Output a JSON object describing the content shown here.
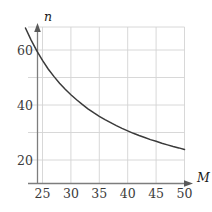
{
  "chart_data": {
    "type": "line",
    "title": "",
    "xlabel": "M",
    "ylabel": "n",
    "xlim": [
      22,
      50
    ],
    "ylim": [
      13.5,
      70
    ],
    "grid": true,
    "legend": null,
    "x_ticks": [
      25,
      30,
      35,
      40,
      45,
      50
    ],
    "y_ticks": [
      20,
      40,
      60
    ],
    "x_tick_labels": [
      "25",
      "30",
      "35",
      "40",
      "45",
      "50"
    ],
    "y_tick_labels": [
      "20",
      "40",
      "60"
    ],
    "series": [
      {
        "name": "n vs M",
        "x": [
          22,
          23,
          24,
          25,
          26,
          27,
          28,
          29,
          30,
          31,
          32,
          33,
          34,
          35,
          36,
          37,
          38,
          39,
          40,
          41,
          42,
          43,
          44,
          45,
          46,
          47,
          48,
          49,
          50
        ],
        "y": [
          68.0,
          63.6,
          59.7,
          56.2,
          53.1,
          50.4,
          47.9,
          45.7,
          43.7,
          41.9,
          40.2,
          38.6,
          37.2,
          35.9,
          34.7,
          33.6,
          32.5,
          31.5,
          30.6,
          29.7,
          28.9,
          28.2,
          27.4,
          26.8,
          26.1,
          25.5,
          24.9,
          24.4,
          23.8
        ]
      }
    ]
  },
  "axis_labels": {
    "x_name": "M",
    "y_name": "n"
  },
  "colors": {
    "curve": "#3a3a3a",
    "grid": "#d4d4d4",
    "axis": "#7d7d7d",
    "tick_text": "#3b3b3b",
    "background": "#ffffff"
  }
}
